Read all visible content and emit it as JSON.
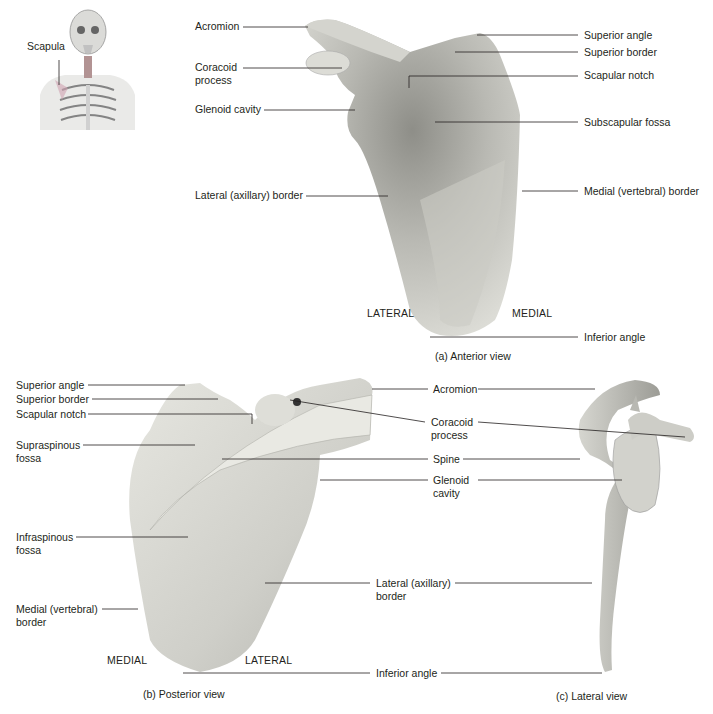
{
  "inset": {
    "label": "Scapula"
  },
  "anterior": {
    "caption": "(a) Anterior view",
    "labels": {
      "acromion": "Acromion",
      "coracoid_1": "Coracoid",
      "coracoid_2": "process",
      "glenoid": "Glenoid cavity",
      "lateral_border": "Lateral (axillary) border",
      "superior_angle": "Superior angle",
      "superior_border": "Superior border",
      "scapular_notch": "Scapular notch",
      "subscapular_fossa": "Subscapular fossa",
      "medial_border": "Medial (vertebral) border",
      "inferior_angle": "Inferior angle"
    },
    "directions": {
      "lateral": "LATERAL",
      "medial": "MEDIAL"
    }
  },
  "posterior": {
    "caption": "(b) Posterior view",
    "labels": {
      "superior_angle": "Superior angle",
      "superior_border": "Superior border",
      "scapular_notch": "Scapular notch",
      "supraspinous_1": "Supraspinous",
      "supraspinous_2": "fossa",
      "infraspinous_1": "Infraspinous",
      "infraspinous_2": "fossa",
      "medial_border_1": "Medial (vertebral)",
      "medial_border_2": "border"
    },
    "directions": {
      "medial": "MEDIAL",
      "lateral": "LATERAL"
    }
  },
  "shared": {
    "acromion": "Acromion",
    "coracoid_1": "Coracoid",
    "coracoid_2": "process",
    "spine": "Spine",
    "glenoid_1": "Glenoid",
    "glenoid_2": "cavity",
    "lateral_border_1": "Lateral (axillary)",
    "lateral_border_2": "border",
    "inferior_angle": "Inferior angle"
  },
  "lateral_view": {
    "caption": "(c) Lateral view"
  },
  "colors": {
    "bone": "#d9d9d3",
    "bone_shadow": "#9a9a94",
    "leader": "#231f20"
  }
}
